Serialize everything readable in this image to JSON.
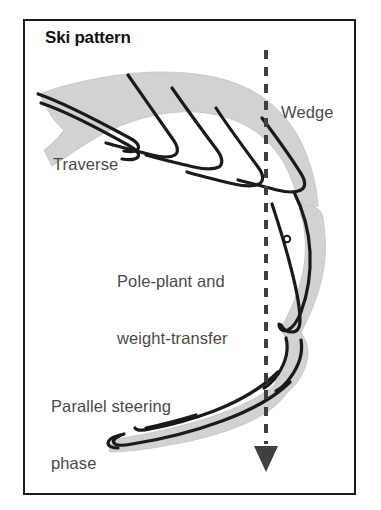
{
  "figure": {
    "title": "Ski pattern",
    "width": 381,
    "height": 510,
    "background": "#ffffff",
    "border_color": "#1a1a1a"
  },
  "diagram": {
    "type": "ski-turn-trajectory",
    "colors": {
      "swath_fill": "#d2d2d2",
      "swath_edge": "#c4c4c4",
      "ski_line": "#1a1a1a",
      "fall_line": "#3f3f3f",
      "label_text": "#4a4a4a",
      "title_text": "#111111"
    },
    "fall_line": {
      "name": "fall-line",
      "style": "dashed",
      "x": 266,
      "y_start": 50,
      "y_end": 444,
      "dash": 9,
      "gap": 8,
      "width": 4,
      "arrow_tip_y": 472,
      "arrow_head_width": 24,
      "arrow_head_height": 26
    },
    "pole_plant_mark": {
      "name": "pole-plant-circle",
      "cx": 287,
      "cy": 239,
      "r": 3
    }
  },
  "labels": {
    "wedge": "Wedge",
    "traverse": "Traverse",
    "pole_plant_line1": "Pole-plant and",
    "pole_plant_line2": "weight-transfer",
    "parallel_line1": "Parallel steering",
    "parallel_line2": "phase"
  }
}
